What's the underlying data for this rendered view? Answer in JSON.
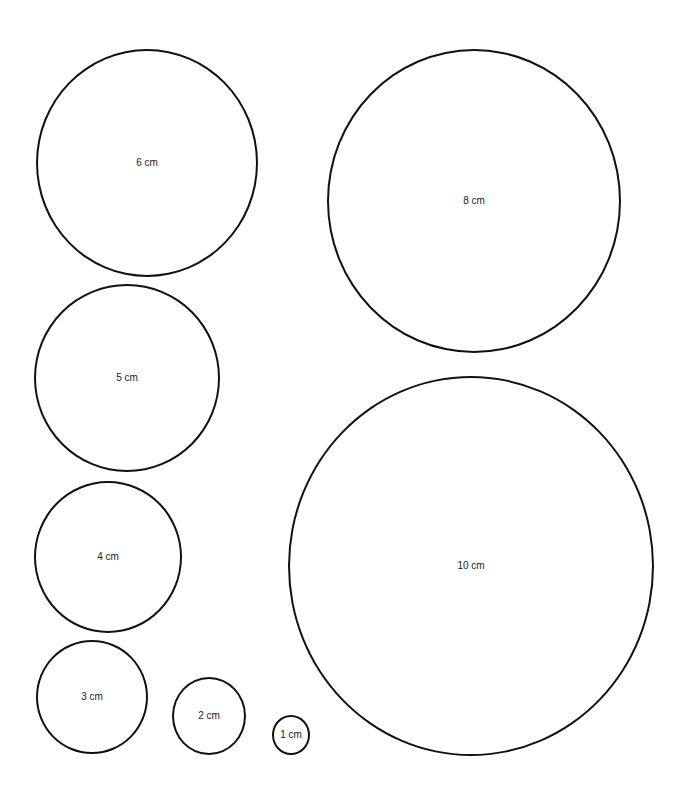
{
  "page": {
    "background": "#ffffff",
    "stroke_color": "#111111",
    "label_color": "#222222"
  },
  "circles": [
    {
      "id": "circle-6cm",
      "label": "6 cm",
      "cx": 147,
      "cy": 163,
      "rx": 111,
      "ry": 114
    },
    {
      "id": "circle-8cm",
      "label": "8 cm",
      "cx": 474,
      "cy": 201,
      "rx": 147,
      "ry": 152
    },
    {
      "id": "circle-5cm",
      "label": "5 cm",
      "cx": 127,
      "cy": 378,
      "rx": 93,
      "ry": 94
    },
    {
      "id": "circle-10cm",
      "label": "10 cm",
      "cx": 471,
      "cy": 566,
      "rx": 183,
      "ry": 190
    },
    {
      "id": "circle-4cm",
      "label": "4 cm",
      "cx": 108,
      "cy": 557,
      "rx": 74,
      "ry": 76
    },
    {
      "id": "circle-3cm",
      "label": "3 cm",
      "cx": 92,
      "cy": 697,
      "rx": 56,
      "ry": 57
    },
    {
      "id": "circle-2cm",
      "label": "2 cm",
      "cx": 209,
      "cy": 716,
      "rx": 37,
      "ry": 39
    },
    {
      "id": "circle-1cm",
      "label": "1 cm",
      "cx": 291,
      "cy": 735,
      "rx": 19,
      "ry": 20
    }
  ]
}
